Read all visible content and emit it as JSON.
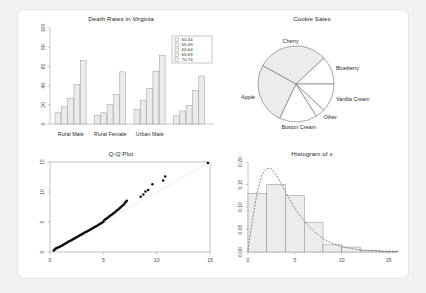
{
  "canvas": {
    "width": 426,
    "height": 293,
    "background": "#f2f2f2",
    "panel_background": "#ffffff"
  },
  "chart_data": [
    {
      "id": "barplot",
      "type": "bar",
      "title": "Death Rates in Virginia",
      "xlabel": "",
      "ylabel": "",
      "ylim": [
        0,
        100
      ],
      "yticks": [
        "0",
        "20",
        "40",
        "60",
        "80",
        "100"
      ],
      "ytick_values": [
        0,
        20,
        40,
        60,
        80,
        100
      ],
      "grid": false,
      "grouped": true,
      "legend_position": "top-right",
      "legend_title": "",
      "categories": [
        "Rural Male",
        "Rural Female",
        "Urban Male",
        "Urban Female"
      ],
      "series": [
        {
          "name": "50-54",
          "values": [
            11.7,
            8.7,
            15.4,
            8.4
          ]
        },
        {
          "name": "55-59",
          "values": [
            18.1,
            11.7,
            24.3,
            13.6
          ]
        },
        {
          "name": "60-64",
          "values": [
            26.9,
            20.3,
            37.0,
            19.3
          ]
        },
        {
          "name": "65-69",
          "values": [
            41.0,
            30.9,
            54.6,
            35.1
          ]
        },
        {
          "name": "70-74",
          "values": [
            66.0,
            54.3,
            71.1,
            50.0
          ]
        }
      ],
      "bar_fill": "#ebebeb",
      "bar_stroke": "#9a9a9a"
    },
    {
      "id": "piechart",
      "type": "pie",
      "title": "Cookie Sales",
      "labels": [
        "Blueberry",
        "Cherry",
        "Apple",
        "Boston Cream",
        "Other",
        "Vanilla Cream"
      ],
      "values": [
        12,
        30,
        26,
        16,
        4,
        12
      ],
      "start_angle_deg": 0,
      "direction": "counterclockwise",
      "slice_fill": "#ececec",
      "slice_stroke": "#5d5d5d"
    },
    {
      "id": "qqplot",
      "type": "scatter",
      "title": "Q-Q Plot",
      "xlabel": "",
      "ylabel": "",
      "xlim": [
        0,
        15
      ],
      "ylim": [
        0,
        15
      ],
      "xticks": [
        "0",
        "5",
        "10",
        "15"
      ],
      "yticks": [
        "0",
        "5",
        "10",
        "15"
      ],
      "xtick_values": [
        0,
        5,
        10,
        15
      ],
      "ytick_values": [
        0,
        5,
        10,
        15
      ],
      "grid": false,
      "reference_line": {
        "from": [
          0,
          0
        ],
        "to": [
          15,
          15
        ],
        "color": "#d8d8d8"
      },
      "point_color": "#0d0d0d",
      "points": [
        [
          0.35,
          0.25
        ],
        [
          0.45,
          0.4
        ],
        [
          0.52,
          0.55
        ],
        [
          0.6,
          0.62
        ],
        [
          0.68,
          0.7
        ],
        [
          0.8,
          0.8
        ],
        [
          0.92,
          0.88
        ],
        [
          1.05,
          0.98
        ],
        [
          1.15,
          1.1
        ],
        [
          1.25,
          1.22
        ],
        [
          1.38,
          1.32
        ],
        [
          1.48,
          1.45
        ],
        [
          1.58,
          1.55
        ],
        [
          1.7,
          1.7
        ],
        [
          1.82,
          1.8
        ],
        [
          1.95,
          1.92
        ],
        [
          2.05,
          2.0
        ],
        [
          2.15,
          2.12
        ],
        [
          2.25,
          2.22
        ],
        [
          2.38,
          2.32
        ],
        [
          2.48,
          2.45
        ],
        [
          2.58,
          2.55
        ],
        [
          2.7,
          2.68
        ],
        [
          2.8,
          2.78
        ],
        [
          2.92,
          2.88
        ],
        [
          3.02,
          2.98
        ],
        [
          3.12,
          3.1
        ],
        [
          3.22,
          3.2
        ],
        [
          3.35,
          3.32
        ],
        [
          3.45,
          3.42
        ],
        [
          3.55,
          3.52
        ],
        [
          3.68,
          3.62
        ],
        [
          3.78,
          3.75
        ],
        [
          3.88,
          3.85
        ],
        [
          4.0,
          3.95
        ],
        [
          4.1,
          4.08
        ],
        [
          4.22,
          4.18
        ],
        [
          4.32,
          4.3
        ],
        [
          4.45,
          4.42
        ],
        [
          4.55,
          4.55
        ],
        [
          4.68,
          4.68
        ],
        [
          4.78,
          4.8
        ],
        [
          4.9,
          4.92
        ],
        [
          5.0,
          5.05
        ],
        [
          5.08,
          5.3
        ],
        [
          5.18,
          5.45
        ],
        [
          5.28,
          5.55
        ],
        [
          5.4,
          5.72
        ],
        [
          5.52,
          5.88
        ],
        [
          5.62,
          6.0
        ],
        [
          5.72,
          6.15
        ],
        [
          5.85,
          6.3
        ],
        [
          5.95,
          6.45
        ],
        [
          6.05,
          6.6
        ],
        [
          6.18,
          6.75
        ],
        [
          6.28,
          6.95
        ],
        [
          6.4,
          7.1
        ],
        [
          6.52,
          7.3
        ],
        [
          6.62,
          7.45
        ],
        [
          6.75,
          7.65
        ],
        [
          6.88,
          7.85
        ],
        [
          6.98,
          8.05
        ],
        [
          7.05,
          8.25
        ],
        [
          7.15,
          8.4
        ],
        [
          7.2,
          8.55
        ],
        [
          8.5,
          9.2
        ],
        [
          8.75,
          9.6
        ],
        [
          8.95,
          10.1
        ],
        [
          9.2,
          10.35
        ],
        [
          9.6,
          11.3
        ],
        [
          10.6,
          11.9
        ],
        [
          10.8,
          12.6
        ],
        [
          14.8,
          14.85
        ]
      ]
    },
    {
      "id": "histogram",
      "type": "bar",
      "title": "Histogram of x",
      "xlabel": "",
      "ylabel": "",
      "xlim": [
        0,
        16
      ],
      "ylim": [
        0,
        0.2
      ],
      "xticks": [
        "0",
        "5",
        "10",
        "15"
      ],
      "xtick_values": [
        0,
        5,
        10,
        15
      ],
      "yticks": [
        "0.00",
        "0.05",
        "0.10",
        "0.15",
        "0.20"
      ],
      "ytick_values": [
        0,
        0.05,
        0.1,
        0.15,
        0.2
      ],
      "grid": false,
      "bin_edges": [
        0,
        2,
        4,
        6,
        8,
        10,
        12,
        14,
        16
      ],
      "values": [
        0.13,
        0.15,
        0.125,
        0.065,
        0.016,
        0.011,
        0.003,
        0.002
      ],
      "bar_fill": "#ececec",
      "bar_stroke": "#8a8a8a",
      "density_curve": {
        "label": "density",
        "style": "dashed",
        "color": "#555555",
        "points": [
          [
            0.0,
            0.004
          ],
          [
            0.5,
            0.075
          ],
          [
            1.0,
            0.135
          ],
          [
            1.5,
            0.172
          ],
          [
            2.0,
            0.186
          ],
          [
            2.5,
            0.185
          ],
          [
            3.0,
            0.172
          ],
          [
            3.5,
            0.154
          ],
          [
            4.0,
            0.134
          ],
          [
            4.5,
            0.115
          ],
          [
            5.0,
            0.097
          ],
          [
            5.5,
            0.082
          ],
          [
            6.0,
            0.069
          ],
          [
            6.5,
            0.057
          ],
          [
            7.0,
            0.047
          ],
          [
            7.5,
            0.038
          ],
          [
            8.0,
            0.03
          ],
          [
            8.5,
            0.024
          ],
          [
            9.0,
            0.019
          ],
          [
            9.5,
            0.015
          ],
          [
            10.0,
            0.012
          ],
          [
            10.5,
            0.01
          ],
          [
            11.0,
            0.008
          ],
          [
            11.5,
            0.006
          ],
          [
            12.0,
            0.005
          ],
          [
            13.0,
            0.003
          ],
          [
            14.0,
            0.002
          ],
          [
            15.0,
            0.001
          ],
          [
            16.0,
            0.001
          ]
        ]
      }
    }
  ]
}
